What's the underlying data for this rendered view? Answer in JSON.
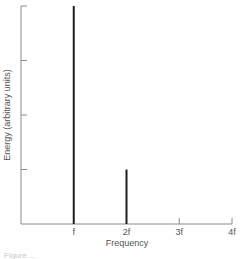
{
  "chart_data": {
    "type": "bar",
    "title": "",
    "xlabel": "Frequency",
    "ylabel": "Energy (arbitrary units)",
    "categories": [
      "f",
      "2f",
      "3f",
      "4f"
    ],
    "x": [
      1,
      2,
      3,
      4
    ],
    "values": [
      1.0,
      0.25,
      0,
      0
    ],
    "ylim": [
      0,
      1
    ],
    "xlim": [
      0,
      4
    ],
    "y_ticks": [
      0.25,
      0.5,
      0.75,
      1.0
    ],
    "y_tick_labels_shown": false,
    "grid": false,
    "legend": null,
    "caption": "Figure ..."
  }
}
